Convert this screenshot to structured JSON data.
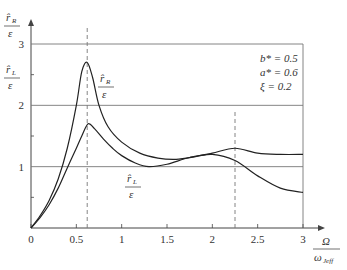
{
  "chart_data": {
    "type": "line",
    "title": "",
    "xlabel": "Ω / ω_Jeff",
    "ylabel": "r̂_R / ε , r̂_L / ε",
    "xlim": [
      0,
      3
    ],
    "ylim": [
      0,
      3
    ],
    "x_ticks": [
      "0",
      "0.5",
      "1",
      "1.5",
      "2",
      "2.5",
      "3"
    ],
    "y_ticks": [
      "1",
      "2",
      "3"
    ],
    "grid": "horizontal lines at y=1, 2, 3; vertical line at x=3",
    "dashed_markers_x": [
      0.62,
      2.25
    ],
    "annotations": [
      "b* = 0.5",
      "a* = 0.6",
      "ξ = 0.2"
    ],
    "series": [
      {
        "name": "r̂_R / ε",
        "x": [
          0,
          0.1,
          0.2,
          0.3,
          0.4,
          0.5,
          0.56,
          0.62,
          0.68,
          0.75,
          0.85,
          1.0,
          1.2,
          1.4,
          1.6,
          1.8,
          2.0,
          2.25,
          2.5,
          2.75,
          3.0
        ],
        "values": [
          0,
          0.2,
          0.45,
          0.8,
          1.3,
          2.0,
          2.55,
          2.7,
          2.45,
          2.0,
          1.65,
          1.4,
          1.22,
          1.14,
          1.12,
          1.16,
          1.22,
          1.3,
          1.22,
          1.2,
          1.2
        ]
      },
      {
        "name": "r̂_L / ε",
        "x": [
          0,
          0.1,
          0.2,
          0.3,
          0.4,
          0.5,
          0.56,
          0.63,
          0.7,
          0.8,
          0.9,
          1.0,
          1.15,
          1.3,
          1.5,
          1.75,
          2.0,
          2.25,
          2.5,
          2.75,
          3.0
        ],
        "values": [
          0,
          0.17,
          0.38,
          0.65,
          0.98,
          1.3,
          1.5,
          1.7,
          1.62,
          1.45,
          1.3,
          1.18,
          1.06,
          1.0,
          1.04,
          1.15,
          1.2,
          1.1,
          0.85,
          0.65,
          0.58
        ]
      }
    ]
  },
  "labels": {
    "y_axis_top_num": "r̂",
    "y_axis_top_sub": "R",
    "y_axis_top_den": "ε",
    "y_axis_mid_num": "r̂",
    "y_axis_mid_sub": "L",
    "y_axis_mid_den": "ε",
    "curve_R_num": "r̂",
    "curve_R_sub": "R",
    "curve_R_den": "ε",
    "curve_L_num": "r̂",
    "curve_L_sub": "L",
    "curve_L_den": "ε",
    "x_axis_num": "Ω",
    "x_axis_den": "ω",
    "x_axis_den_sub": "Jeff",
    "param_b": "b* = 0.5",
    "param_a": "a* = 0.6",
    "param_xi": "ξ = 0.2"
  }
}
